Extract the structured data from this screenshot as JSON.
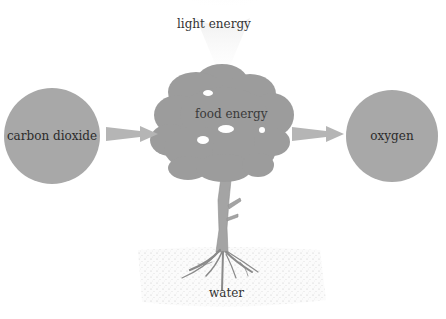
{
  "diagram": {
    "labels": {
      "light": "light energy",
      "input": "carbon dioxide",
      "center": "food energy",
      "output": "oxygen",
      "bottom": "water"
    },
    "colors": {
      "circle": "#a8a8a8",
      "tree": "#9a9a9a",
      "arrow": "#b5b5b5",
      "text": "#333333",
      "soil": "#e8e8e8"
    }
  }
}
